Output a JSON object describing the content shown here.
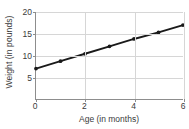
{
  "chart_data": {
    "type": "line",
    "title": "",
    "xlabel": "Age (in months)",
    "ylabel": "Weight (in pounds)",
    "x": [
      0,
      1,
      2,
      3,
      4,
      5,
      6
    ],
    "values": [
      7,
      8.7,
      10.4,
      12.1,
      13.8,
      15.3,
      17
    ],
    "series": [
      {
        "name": "Weight",
        "values": [
          7,
          8.7,
          10.4,
          12.1,
          13.8,
          15.3,
          17
        ]
      }
    ],
    "xlim": [
      0,
      6
    ],
    "ylim": [
      0,
      20
    ],
    "xticks": [
      0,
      2,
      4,
      6
    ],
    "xtick_labels": [
      "0",
      "2",
      "4",
      "6"
    ],
    "yticks": [
      5,
      10,
      15,
      20
    ],
    "ytick_labels": [
      "5",
      "10",
      "15",
      "20"
    ],
    "grid": true,
    "grid_y_values": [
      5,
      10,
      15,
      20
    ],
    "grid_x_values": [
      2,
      4,
      6
    ],
    "legend": "none",
    "markers": true,
    "line_color": "#1a1a1a",
    "marker_color": "#1a1a1a",
    "grid_color": "#d6d6d6",
    "axis_color": "#8d8d8d",
    "text_color": "#3b3b3b",
    "background_color": "#ffffff"
  }
}
